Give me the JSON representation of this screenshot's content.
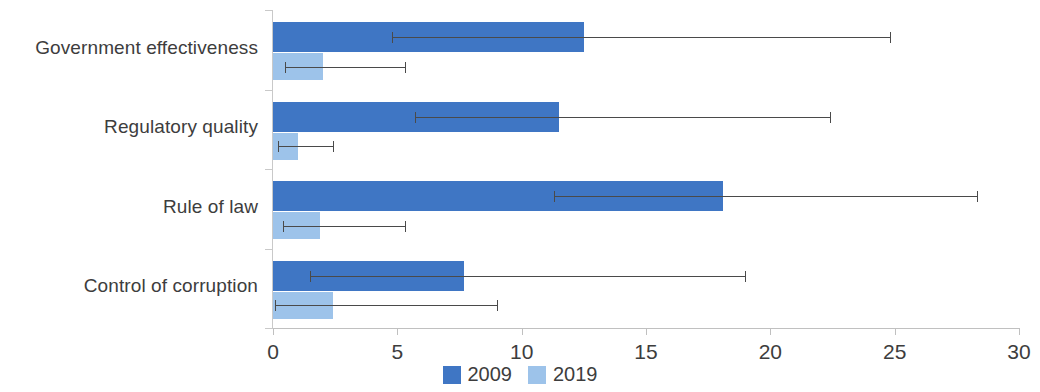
{
  "chart_data": {
    "type": "bar",
    "orientation": "horizontal",
    "title": "",
    "xlabel": "",
    "ylabel": "",
    "xlim": [
      0,
      30
    ],
    "xticks": [
      0,
      5,
      10,
      15,
      20,
      25,
      30
    ],
    "xtick_labels": [
      "0",
      "5",
      "10",
      "15",
      "20",
      "25",
      "30"
    ],
    "grid": false,
    "legend_position": "bottom-center",
    "categories": [
      "Government effectiveness",
      "Regulatory quality",
      "Rule of law",
      "Control of corruption"
    ],
    "series": [
      {
        "name": "2009",
        "color": "#3f76c4",
        "values": [
          12.5,
          11.5,
          18.1,
          7.7
        ],
        "error_low": [
          4.8,
          5.7,
          11.3,
          1.5
        ],
        "error_high": [
          24.8,
          22.4,
          28.3,
          19.0
        ]
      },
      {
        "name": "2019",
        "color": "#9dc3ea",
        "values": [
          2.0,
          1.0,
          1.9,
          2.4
        ],
        "error_low": [
          0.5,
          0.2,
          0.4,
          0.1
        ],
        "error_high": [
          5.3,
          2.4,
          5.3,
          9.0
        ]
      }
    ]
  },
  "legend": {
    "items": [
      {
        "label": "2009",
        "color": "#3f76c4"
      },
      {
        "label": "2019",
        "color": "#9dc3ea"
      }
    ]
  }
}
